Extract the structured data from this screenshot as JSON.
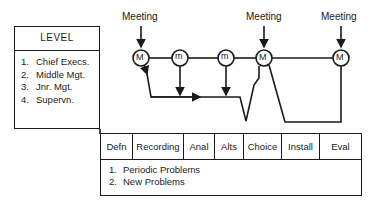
{
  "level_box": {
    "title": "LEVEL",
    "items": [
      {
        "num": "1.",
        "label": "Chief Execs."
      },
      {
        "num": "2.",
        "label": "Middle Mgt."
      },
      {
        "num": "3.",
        "label": "Jnr. Mgt."
      },
      {
        "num": "4.",
        "label": "Supervn."
      }
    ]
  },
  "meetings": [
    {
      "label": "Meeting",
      "node": "M"
    },
    {
      "label": "Meeting",
      "node": "M"
    },
    {
      "label": "Meeting",
      "node": "M"
    }
  ],
  "nodes": [
    "M",
    "m",
    "m",
    "M",
    "M"
  ],
  "phases": [
    {
      "label": "Defn"
    },
    {
      "label": "Recording"
    },
    {
      "label": "Anal"
    },
    {
      "label": "Alts"
    },
    {
      "label": "Choice"
    },
    {
      "label": "Install"
    },
    {
      "label": "Eval"
    }
  ],
  "problems": [
    {
      "num": "1.",
      "label": "Periodic Problems"
    },
    {
      "num": "2.",
      "label": "New Problems"
    }
  ]
}
